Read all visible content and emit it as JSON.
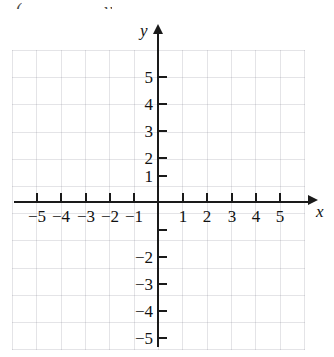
{
  "figure": {
    "type": "coordinate-plane",
    "x_axis_label": "x",
    "y_axis_label": "y",
    "top_edge_artifacts": [
      "(",
      "y"
    ]
  },
  "chart_data": {
    "type": "scatter",
    "title": "",
    "subtitle": "",
    "xlabel": "x",
    "ylabel": "y",
    "xlim": [
      -6,
      6
    ],
    "ylim": [
      -6,
      6
    ],
    "grid": true,
    "grid_spacing": 1,
    "legend": null,
    "series": [
      {
        "name": "plotted-points",
        "x": [],
        "y": []
      }
    ],
    "annotations": [],
    "x_ticks": [
      -5,
      -4,
      -3,
      -2,
      -1,
      1,
      2,
      3,
      4,
      5
    ],
    "y_ticks": [
      5,
      4,
      3,
      2,
      1,
      -1,
      -2,
      -3,
      -4,
      -5
    ],
    "x_tick_labels": [
      "−5",
      "−4",
      "−3",
      "−2",
      "−1",
      "1",
      "2",
      "3",
      "4",
      "5"
    ],
    "y_tick_labels": [
      "5",
      "4",
      "3",
      "2",
      "1",
      "",
      "−2",
      "−3",
      "−4",
      "−5"
    ],
    "colors": {
      "axis": "#1a1a1a",
      "grid": "#c8c8cf",
      "text": "#111111",
      "background": "#ffffff"
    }
  },
  "ticks": {
    "x": [
      {
        "value": -5,
        "label": "−5",
        "px": 36
      },
      {
        "value": -4,
        "label": "−4",
        "px": 60
      },
      {
        "value": -3,
        "label": "−3",
        "px": 85
      },
      {
        "value": -2,
        "label": "−2",
        "px": 109
      },
      {
        "value": -1,
        "label": "−1",
        "px": 133
      },
      {
        "value": 1,
        "label": "1",
        "px": 182
      },
      {
        "value": 2,
        "label": "2",
        "px": 206
      },
      {
        "value": 3,
        "label": "3",
        "px": 231
      },
      {
        "value": 4,
        "label": "4",
        "px": 255
      },
      {
        "value": 5,
        "label": "5",
        "px": 279
      }
    ],
    "y": [
      {
        "value": 5,
        "label": "5",
        "px": 76
      },
      {
        "value": 4,
        "label": "4",
        "px": 103
      },
      {
        "value": 3,
        "label": "3",
        "px": 130
      },
      {
        "value": 2,
        "label": "2",
        "px": 157
      },
      {
        "value": 1,
        "label": "1",
        "px": 175
      },
      {
        "value": -1,
        "label": "",
        "px": 229
      },
      {
        "value": -2,
        "label": "−2",
        "px": 256
      },
      {
        "value": -3,
        "label": "−3",
        "px": 283
      },
      {
        "value": -4,
        "label": "−4",
        "px": 310
      },
      {
        "value": -5,
        "label": "−5",
        "px": 337
      }
    ]
  }
}
